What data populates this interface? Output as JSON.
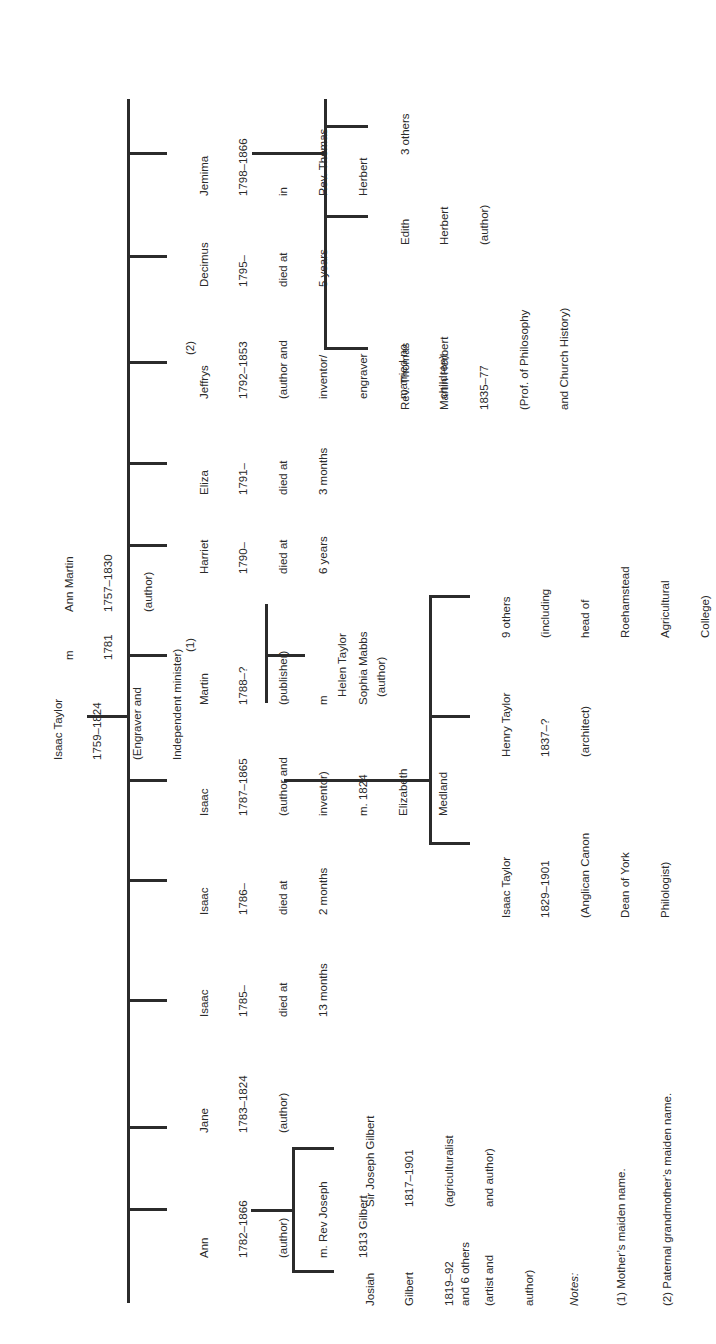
{
  "parents": {
    "father": [
      "Isaac Taylor",
      "1759–1824",
      "(Engraver and",
      "Independent minister)"
    ],
    "marriage": [
      "m",
      "1781"
    ],
    "mother": [
      "Ann Martin",
      "1757–1830",
      "(author)"
    ]
  },
  "children": [
    {
      "id": "ann",
      "lines": [
        "Ann",
        "1782–1866",
        "(author)",
        "m. Rev Joseph",
        "1813 Gilbert"
      ]
    },
    {
      "id": "jane",
      "lines": [
        "Jane",
        "1783–1824",
        "(author)"
      ]
    },
    {
      "id": "isaac-1785",
      "lines": [
        "Isaac",
        "1785–",
        "died at",
        "13 months"
      ]
    },
    {
      "id": "isaac-1786",
      "lines": [
        "Isaac",
        "1786–",
        "died at",
        "2 months"
      ]
    },
    {
      "id": "isaac-1787",
      "lines": [
        "Isaac",
        "1787–1865",
        "(author and",
        "inventor)",
        "m. 1824",
        "Elizabeth",
        "Medland"
      ]
    },
    {
      "id": "martin",
      "note": "(1)",
      "lines": [
        "Martin",
        "1788–?",
        "(publisher)",
        "m",
        "Sophia Mabbs"
      ]
    },
    {
      "id": "harriet",
      "lines": [
        "Harriet",
        "1790–",
        "died at",
        "6 years"
      ]
    },
    {
      "id": "eliza",
      "lines": [
        "Eliza",
        "1791–",
        "died at",
        "3 months"
      ]
    },
    {
      "id": "jeffrys",
      "note": "(2)",
      "lines": [
        "Jeffrys",
        "1792–1853",
        "(author and",
        "inventor/",
        "engraver",
        "married no",
        "children)"
      ]
    },
    {
      "id": "decimus",
      "lines": [
        "Decimus",
        "1795–",
        "died at",
        "5 years"
      ]
    },
    {
      "id": "jemima",
      "lines": [
        "Jemima",
        "1798–1866",
        "in",
        "Rev. Thomas",
        "Herbert"
      ]
    }
  ],
  "grandchildren": {
    "ann": [
      {
        "lines": [
          "Josiah",
          "Gilbert",
          "1819–92",
          "(artist and",
          "author)"
        ]
      },
      {
        "lines": [
          "Sir Joseph Gilbert",
          "1817–1901",
          "(agriculturalist",
          "and author)"
        ]
      }
    ],
    "ann_others": "and 6 others",
    "isaac": [
      {
        "lines": [
          "Isaac Taylor",
          "1829–1901",
          "(Anglican Canon",
          "Dean of York",
          "Philologist)"
        ]
      },
      {
        "lines": [
          "Henry Taylor",
          "1837–?",
          "(architect)"
        ]
      },
      {
        "lines": [
          "9 others",
          "(including",
          "head of",
          "Roehamstead",
          "Agricultural",
          "College)"
        ]
      }
    ],
    "martin": [
      {
        "lines": [
          "Helen Taylor",
          "(author)"
        ]
      }
    ],
    "jemima": [
      {
        "lines": [
          "Rev. Thomas",
          "Martin Herbert",
          "1835–77",
          "(Prof. of Philosophy",
          "and Church History)"
        ]
      },
      {
        "lines": [
          "Edith",
          "Herbert",
          "(author)"
        ]
      },
      {
        "lines": [
          "3 others"
        ]
      }
    ]
  },
  "notes": {
    "heading": "Notes:",
    "items": [
      "(1) Mother’s maiden name.",
      "(2) Paternal grandmother’s maiden name."
    ]
  }
}
